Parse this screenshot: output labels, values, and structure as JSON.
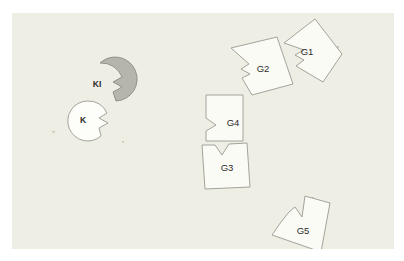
{
  "app": {
    "title": "Shape Canvas",
    "background_color": "#ffffff",
    "panel_color": "#eeeee4",
    "outline_color": "#9a9a92",
    "label_color": "#2a2a2a"
  },
  "canvas": {
    "width": 382,
    "height": 236,
    "origin_x": 12,
    "origin_y": 13
  },
  "pieces": [
    {
      "id": "G1",
      "label": "G1",
      "kind": "notched-quad",
      "fill": "#fbfbf6",
      "rotation_deg": -22,
      "label_x": 293,
      "label_y": 40,
      "points": "272,30 303,6 330,41 311,69 284,53 292,47 283,42 292,37"
    },
    {
      "id": "G2",
      "label": "G2",
      "kind": "notched-quad",
      "fill": "#fbfbf6",
      "rotation_deg": -20,
      "label_x": 251,
      "label_y": 56,
      "points": "219,35 265,24 281,71 240,82 230,65 238,61 229,56 237,51"
    },
    {
      "id": "G3",
      "label": "G3",
      "kind": "notched-square-top",
      "fill": "#fbfbf6",
      "rotation_deg": 3,
      "label_x": 217,
      "label_y": 154,
      "points": "190,132 203,132 210,142 217,131 235,130 238,174 193,176"
    },
    {
      "id": "G4",
      "label": "G4",
      "kind": "notched-square-left",
      "fill": "#fbfbf6",
      "rotation_deg": 0,
      "label_x": 221,
      "label_y": 114,
      "points": "194,82 231,82 231,128 194,128 194,118 204,112 194,105"
    },
    {
      "id": "G5",
      "label": "G5",
      "kind": "notched-quad",
      "fill": "#fbfbf6",
      "rotation_deg": 18,
      "label_x": 291,
      "label_y": 218,
      "points": "277,199 283,194 290,204 293,183 318,190 309,239 260,222 269,209"
    }
  ],
  "disks": [
    {
      "id": "KI",
      "label": "KI",
      "fill": "#b5b5ac",
      "stroke": "#8a8a82",
      "center_x": 88,
      "center_y": 72,
      "radius": 22,
      "notch": "right-zigzag",
      "label_x": 85,
      "label_y": 72
    },
    {
      "id": "K",
      "label": "K",
      "fill": "#fdfdfa",
      "stroke": "#9a9a92",
      "center_x": 75,
      "center_y": 108,
      "radius": 20,
      "notch": "right-zigzag",
      "label_x": 71,
      "label_y": 108
    }
  ],
  "specks": [
    {
      "x": 40,
      "y": 118,
      "w": 3,
      "h": 1.5
    },
    {
      "x": 110,
      "y": 128,
      "w": 2,
      "h": 1.5
    },
    {
      "x": 325,
      "y": 33,
      "w": 2,
      "h": 2
    },
    {
      "x": 300,
      "y": 184,
      "w": 2,
      "h": 1.5
    }
  ]
}
